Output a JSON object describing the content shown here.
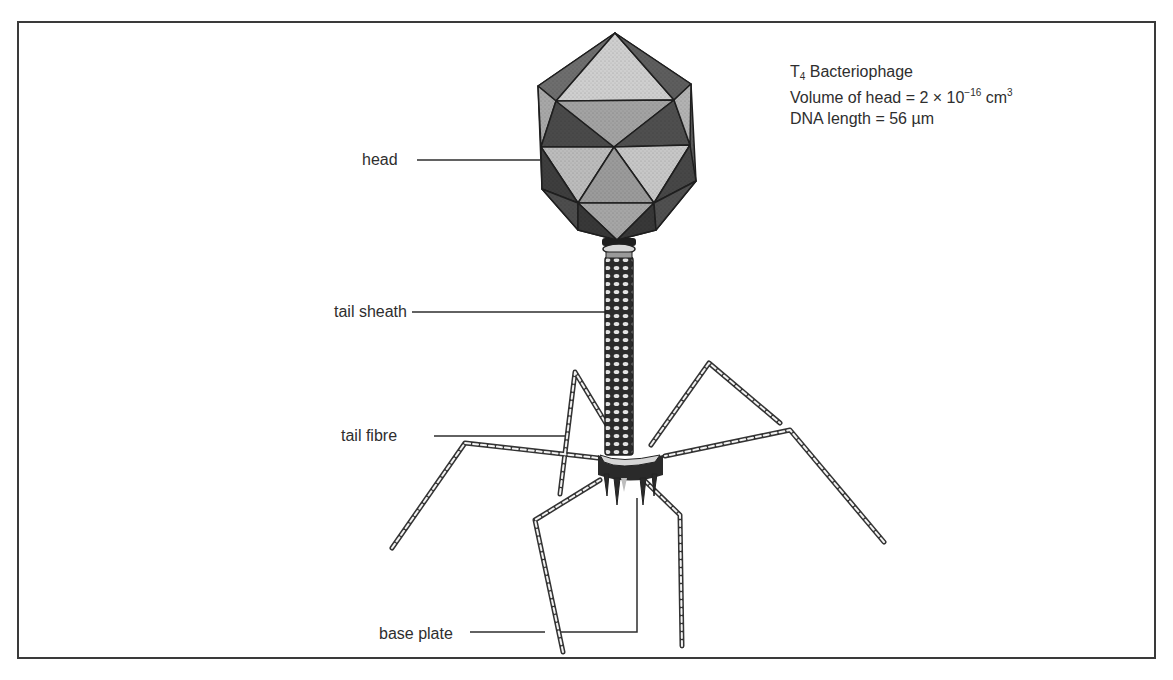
{
  "figure": {
    "title_prefix": "T",
    "title_subscript": "4",
    "title_suffix": " Bacteriophage",
    "volume": {
      "label": "Volume of head = 2 × 10",
      "exponent": "−16",
      "unit_base": " cm",
      "unit_exponent": "3"
    },
    "dna_length": "DNA length = 56 µm"
  },
  "labels": {
    "head": "head",
    "tail_sheath": "tail sheath",
    "tail_fibre": "tail fibre",
    "base_plate": "base plate"
  },
  "colors": {
    "border": "#3a3a3a",
    "ink": "#2e2e2e",
    "face_light": "#c9c9c9",
    "face_mid": "#9a9a9a",
    "face_dark": "#4a4a4a",
    "sheath": "#2b2b2b"
  }
}
